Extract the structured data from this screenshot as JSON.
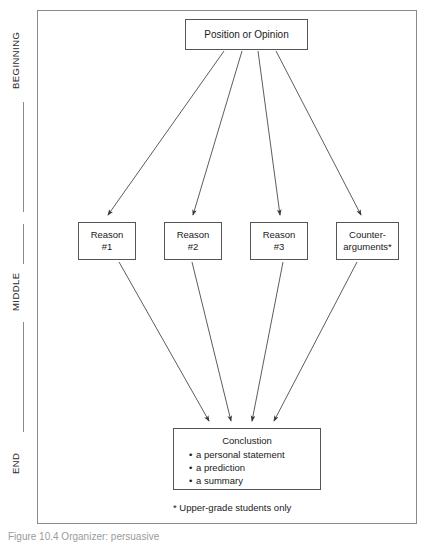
{
  "figure": {
    "caption": "Figure 10.4  Organizer: persuasive",
    "footnote": "* Upper-grade students only"
  },
  "stages": [
    {
      "id": "beginning",
      "label": "BEGINNING"
    },
    {
      "id": "middle",
      "label": "MIDDLE"
    },
    {
      "id": "end",
      "label": "END"
    }
  ],
  "nodes": {
    "position": {
      "title": "Position or Opinion"
    },
    "reason_1": {
      "line1": "Reason",
      "line2": "#1"
    },
    "reason_2": {
      "line1": "Reason",
      "line2": "#2"
    },
    "reason_3": {
      "line1": "Reason",
      "line2": "#3"
    },
    "counter": {
      "line1": "Counter-",
      "line2": "arguments*"
    },
    "conclusion": {
      "title": "Conclustion",
      "bullets": [
        "a personal statement",
        "a prediction",
        "a summary"
      ]
    }
  },
  "colors": {
    "frame_border": "#8a8a8a",
    "node_border": "#555555",
    "connector": "#4a4a4a",
    "text": "#1a1a1a",
    "caption_text": "#9b9b9b",
    "background": "#ffffff"
  },
  "connectors": {
    "diverging_from": "position",
    "diverging_to": [
      "reason_1",
      "reason_2",
      "reason_3",
      "counter"
    ],
    "converging_from": [
      "reason_1",
      "reason_2",
      "reason_3",
      "counter"
    ],
    "converging_to": "conclusion",
    "arrowhead": "filled-triangle"
  }
}
